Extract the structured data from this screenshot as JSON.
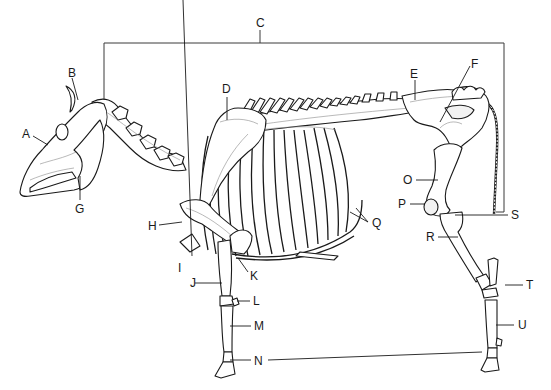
{
  "diagram": {
    "colors": {
      "line": "#1a1a1a",
      "background": "#ffffff",
      "bracket": "#3a3a3a"
    },
    "labels": [
      {
        "id": "A",
        "text": "A",
        "x": 24,
        "y": 137
      },
      {
        "id": "B",
        "text": "B",
        "x": 69,
        "y": 76
      },
      {
        "id": "C",
        "text": "C",
        "x": 255,
        "y": 26
      },
      {
        "id": "D",
        "text": "D",
        "x": 222,
        "y": 91
      },
      {
        "id": "E",
        "text": "E",
        "x": 138,
        "y": 80
      },
      {
        "id": "F",
        "text": "F",
        "x": 201,
        "y": 69
      },
      {
        "id": "G",
        "text": "G",
        "x": 76,
        "y": 213
      },
      {
        "id": "H",
        "text": "H",
        "x": 148,
        "y": 229
      },
      {
        "id": "I",
        "text": "I",
        "x": 178,
        "y": 270
      },
      {
        "id": "J",
        "text": "J",
        "x": 190,
        "y": 287
      },
      {
        "id": "K",
        "text": "K",
        "x": 250,
        "y": 276
      },
      {
        "id": "L",
        "text": "L",
        "x": 253,
        "y": 304
      },
      {
        "id": "M",
        "text": "M",
        "x": 254,
        "y": 330
      },
      {
        "id": "N",
        "text": "N",
        "x": 254,
        "y": 364
      },
      {
        "id": "O",
        "text": "O",
        "x": 403,
        "y": 184
      },
      {
        "id": "P",
        "text": "P",
        "x": 398,
        "y": 209
      },
      {
        "id": "Q",
        "text": "Q",
        "x": 372,
        "y": 227
      },
      {
        "id": "R",
        "text": "R",
        "x": 426,
        "y": 242
      },
      {
        "id": "S",
        "text": "S",
        "x": 512,
        "y": 219
      },
      {
        "id": "T",
        "text": "T",
        "x": 527,
        "y": 289
      },
      {
        "id": "U",
        "text": "U",
        "x": 518,
        "y": 329
      }
    ]
  }
}
